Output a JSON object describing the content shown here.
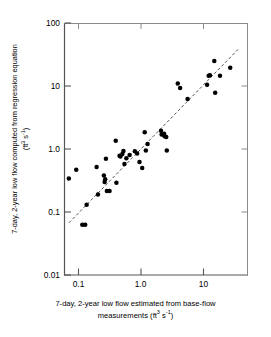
{
  "chart_data": {
    "type": "scatter",
    "title": "",
    "xlabel": "7-day, 2-year low flow estimated from base-flow measurements (ft3 s-1)",
    "ylabel": "7-day, 2-year low flow computed from regression equation (ft3 s-1)",
    "xlabel_line1": "7-day, 2-year low flow estimated from base-flow",
    "xlabel_line2_pre": "measurements (ft",
    "xlabel_sup1": "3",
    "xlabel_mid": " s",
    "xlabel_sup2": "-1",
    "xlabel_end": ")",
    "ylabel_line1": "7-day, 2-year low flow computed from regression equation",
    "ylabel_line2_pre": "(ft",
    "ylabel_sup1": "3",
    "ylabel_mid": " s",
    "ylabel_sup2": "-1",
    "ylabel_end": ")",
    "xscale": "log",
    "yscale": "log",
    "xlim": [
      0.065,
      40
    ],
    "ylim": [
      0.01,
      100
    ],
    "grid": false,
    "legend": false,
    "xticks": [
      0.1,
      1.0,
      10
    ],
    "xtick_labels": [
      "0.1",
      "1.0",
      "10"
    ],
    "yticks": [
      0.01,
      0.1,
      1.0,
      10,
      100
    ],
    "ytick_labels": [
      "0.01",
      "0.1",
      "1.0",
      "10",
      "100"
    ],
    "series": [
      {
        "name": "observations",
        "marker": "filled-circle",
        "color": "#000000",
        "points": [
          [
            0.07,
            0.34
          ],
          [
            0.092,
            0.47
          ],
          [
            0.115,
            0.063
          ],
          [
            0.128,
            0.063
          ],
          [
            0.135,
            0.13
          ],
          [
            0.195,
            0.52
          ],
          [
            0.205,
            0.19
          ],
          [
            0.255,
            0.38
          ],
          [
            0.262,
            0.3
          ],
          [
            0.268,
            0.33
          ],
          [
            0.275,
            0.7
          ],
          [
            0.285,
            0.215
          ],
          [
            0.315,
            0.215
          ],
          [
            0.395,
            1.35
          ],
          [
            0.405,
            0.29
          ],
          [
            0.455,
            0.78
          ],
          [
            0.47,
            0.76
          ],
          [
            0.505,
            0.83
          ],
          [
            0.525,
            0.93
          ],
          [
            0.545,
            0.58
          ],
          [
            0.585,
            0.71
          ],
          [
            0.66,
            0.8
          ],
          [
            0.8,
            0.92
          ],
          [
            0.87,
            0.85
          ],
          [
            0.95,
            0.62
          ],
          [
            1.05,
            0.5
          ],
          [
            1.15,
            1.85
          ],
          [
            1.2,
            0.95
          ],
          [
            1.28,
            1.2
          ],
          [
            2.1,
            1.95
          ],
          [
            2.15,
            1.7
          ],
          [
            2.35,
            1.75
          ],
          [
            2.4,
            1.6
          ],
          [
            2.55,
            1.55
          ],
          [
            2.6,
            0.95
          ],
          [
            3.9,
            11.0
          ],
          [
            4.25,
            9.3
          ],
          [
            5.6,
            6.2
          ],
          [
            11.5,
            10.5
          ],
          [
            12.2,
            14.5
          ],
          [
            12.8,
            14.8
          ],
          [
            15.0,
            25.0
          ],
          [
            15.5,
            7.8
          ],
          [
            18.5,
            14.5
          ],
          [
            27.0,
            19.5
          ]
        ]
      }
    ],
    "trendline": {
      "name": "regression-line",
      "style": "dashed",
      "color": "#555555",
      "x_start": 0.0705,
      "y_start": 0.0675,
      "x_end": 36.0,
      "y_end": 38.0
    }
  }
}
